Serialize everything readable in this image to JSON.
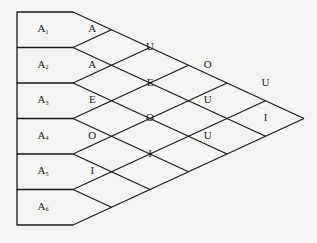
{
  "diagram": {
    "type": "lattice-triangle",
    "rows": [
      {
        "label": "A",
        "sub": "1"
      },
      {
        "label": "A",
        "sub": "2"
      },
      {
        "label": "A",
        "sub": "3"
      },
      {
        "label": "A",
        "sub": "4"
      },
      {
        "label": "A",
        "sub": "5"
      },
      {
        "label": "A",
        "sub": "6"
      }
    ],
    "cells": [
      {
        "col": 1,
        "pos": 1,
        "text": "A"
      },
      {
        "col": 1,
        "pos": 3,
        "text": "A"
      },
      {
        "col": 1,
        "pos": 5,
        "text": "E"
      },
      {
        "col": 1,
        "pos": 7,
        "text": "O"
      },
      {
        "col": 1,
        "pos": 9,
        "text": "I"
      },
      {
        "col": 2,
        "pos": 2,
        "text": "U"
      },
      {
        "col": 2,
        "pos": 4,
        "text": "E"
      },
      {
        "col": 2,
        "pos": 6,
        "text": "O"
      },
      {
        "col": 2,
        "pos": 8,
        "text": "I"
      },
      {
        "col": 3,
        "pos": 3,
        "text": "O"
      },
      {
        "col": 3,
        "pos": 5,
        "text": "U"
      },
      {
        "col": 3,
        "pos": 7,
        "text": "U"
      },
      {
        "col": 4,
        "pos": 4,
        "text": "U"
      },
      {
        "col": 4,
        "pos": 6,
        "text": "I"
      },
      {
        "col": 5,
        "pos": 5,
        "text": "O"
      }
    ]
  }
}
